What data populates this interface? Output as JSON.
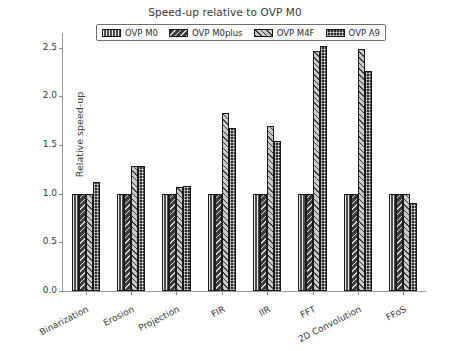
{
  "chart_data": {
    "type": "bar",
    "title": "Speed-up relative to OVP M0",
    "xlabel": "",
    "ylabel": "Relative speed-up",
    "ylim": [
      0.0,
      2.65
    ],
    "yticks": [
      0.0,
      0.5,
      1.0,
      1.5,
      2.0,
      2.5
    ],
    "ytick_labels": [
      "0.0",
      "0.5",
      "1.0",
      "1.5",
      "2.0",
      "2.5"
    ],
    "grid": false,
    "legend_position": "upper center",
    "categories": [
      "Binarization",
      "Erosion",
      "Projection",
      "FIR",
      "IIR",
      "FFT",
      "2D Convolution",
      "FFoS"
    ],
    "series": [
      {
        "name": "OVP M0",
        "color": "#4f4f4f",
        "hatch": "vertical-lines",
        "values": [
          1.0,
          1.0,
          1.0,
          1.0,
          1.0,
          1.0,
          1.0,
          1.0
        ]
      },
      {
        "name": "OVP M0plus",
        "color": "#3c3c3c",
        "hatch": "back-diagonal",
        "values": [
          1.0,
          1.0,
          1.0,
          1.0,
          1.0,
          1.0,
          1.0,
          1.0
        ]
      },
      {
        "name": "OVP M4F",
        "color": "#c9c9c9",
        "hatch": "forward-diagonal",
        "values": [
          1.0,
          1.28,
          1.07,
          1.83,
          1.69,
          2.47,
          2.49,
          1.0
        ]
      },
      {
        "name": "OVP A9",
        "color": "#2a2a2a",
        "hatch": "cross-grid",
        "values": [
          1.12,
          1.28,
          1.08,
          1.67,
          1.54,
          2.52,
          2.26,
          0.9
        ]
      }
    ]
  },
  "legend": {
    "items": [
      {
        "label": "OVP M0"
      },
      {
        "label": "OVP M0plus"
      },
      {
        "label": "OVP M4F"
      },
      {
        "label": "OVP A9"
      }
    ]
  }
}
